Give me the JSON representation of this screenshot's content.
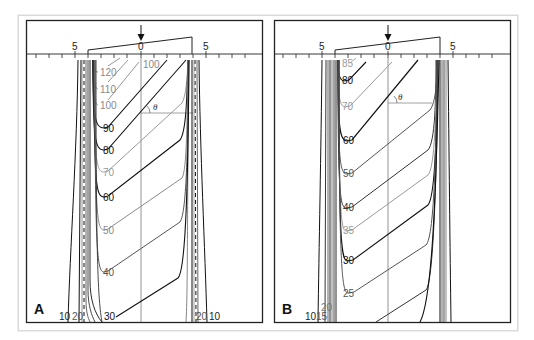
{
  "figure": {
    "panels": [
      {
        "letter": "A",
        "axis_labels": {
          "left": "5",
          "center": "0",
          "right": "5"
        },
        "angle_label": "θ",
        "contours": [
          {
            "value": "120",
            "color": "#8a8a8a"
          },
          {
            "value": "110",
            "color": "#8a8a8a"
          },
          {
            "value": "100",
            "color": "#8a8a8a"
          },
          {
            "value": "100",
            "color": "#8a8a8a",
            "note": "upper label near axis"
          },
          {
            "value": "90",
            "color": "#111111"
          },
          {
            "value": "80",
            "color": "#111111"
          },
          {
            "value": "70",
            "color": "#9a9a9a"
          },
          {
            "value": "60",
            "color": "#111111"
          },
          {
            "value": "50",
            "color": "#8a8a8a"
          },
          {
            "value": "40",
            "color": "#555555"
          },
          {
            "value": "30",
            "color": "#111111"
          }
        ],
        "bottom_labels": {
          "l10": "10",
          "l20": "20",
          "r20": "20",
          "r10": "10"
        }
      },
      {
        "letter": "B",
        "axis_labels": {
          "left": "5",
          "center": "0",
          "right": "5"
        },
        "angle_label": "θ",
        "contours": [
          {
            "value": "85",
            "color": "#9a9a9a"
          },
          {
            "value": "80",
            "color": "#111111"
          },
          {
            "value": "70",
            "color": "#9a9a9a"
          },
          {
            "value": "60",
            "color": "#111111"
          },
          {
            "value": "50",
            "color": "#555555"
          },
          {
            "value": "40",
            "color": "#333333"
          },
          {
            "value": "35",
            "color": "#9a9a9a"
          },
          {
            "value": "30",
            "color": "#111111"
          },
          {
            "value": "25",
            "color": "#555555"
          }
        ],
        "bottom_labels": {
          "l10": "10",
          "l15": "15",
          "l20": "20"
        }
      }
    ],
    "colors": {
      "frame": "#222222",
      "outer_frame": "#d9d9d9",
      "dark_line": "#111111",
      "mid_line": "#555555",
      "light_line": "#9a9a9a"
    }
  }
}
